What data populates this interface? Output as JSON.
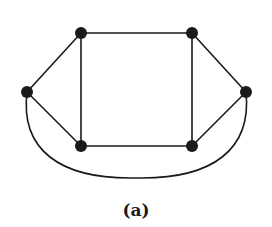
{
  "figure": {
    "caption": "(a)",
    "stroke_color": "#1a1a1a",
    "background": "#ffffff"
  },
  "graph": {
    "nodes": [
      {
        "id": "top-left",
        "x": 81,
        "y": 33
      },
      {
        "id": "top-right",
        "x": 192,
        "y": 33
      },
      {
        "id": "left",
        "x": 27,
        "y": 92
      },
      {
        "id": "right",
        "x": 246,
        "y": 92
      },
      {
        "id": "bottom-left",
        "x": 81,
        "y": 146
      },
      {
        "id": "bottom-right",
        "x": 192,
        "y": 146
      }
    ],
    "edges": [
      {
        "from": "top-left",
        "to": "top-right",
        "type": "straight"
      },
      {
        "from": "bottom-left",
        "to": "bottom-right",
        "type": "straight"
      },
      {
        "from": "top-left",
        "to": "bottom-left",
        "type": "straight"
      },
      {
        "from": "top-right",
        "to": "bottom-right",
        "type": "straight"
      },
      {
        "from": "left",
        "to": "top-left",
        "type": "straight"
      },
      {
        "from": "left",
        "to": "bottom-left",
        "type": "straight"
      },
      {
        "from": "right",
        "to": "top-right",
        "type": "straight"
      },
      {
        "from": "right",
        "to": "bottom-right",
        "type": "straight"
      },
      {
        "from": "left",
        "to": "right",
        "type": "curved-below"
      }
    ],
    "node_count": 6,
    "edge_count": 9
  }
}
